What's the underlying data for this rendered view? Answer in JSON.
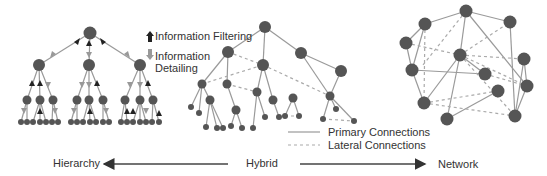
{
  "legend": {
    "filtering": "Information Filtering",
    "detailing_line1": "Information",
    "detailing_line2": "Detailing",
    "primary": "Primary Connections",
    "lateral": "Lateral Connections"
  },
  "axis": {
    "left": "Hierarchy",
    "center": "Hybrid",
    "right": "Network"
  },
  "colors": {
    "node": "#555555",
    "primary_line": "#999999",
    "lateral_line": "#aaaaaa",
    "arrow_up": "#222222",
    "arrow_down": "#999999"
  },
  "panels": [
    "Hierarchy tree",
    "Hybrid tree with lateral connections",
    "Network graph"
  ]
}
